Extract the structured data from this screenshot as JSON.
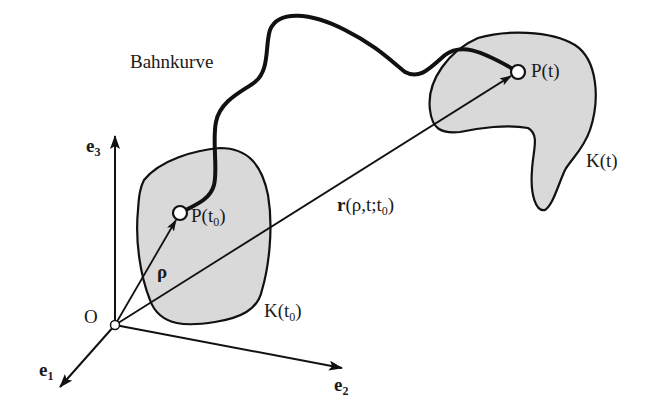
{
  "diagram": {
    "title_label": "Bahnkurve",
    "origin_label": "O",
    "axes": [
      {
        "name": "e1",
        "base": "e",
        "sub": "1"
      },
      {
        "name": "e2",
        "base": "e",
        "sub": "2"
      },
      {
        "name": "e3",
        "base": "e",
        "sub": "3"
      }
    ],
    "points": [
      {
        "name": "P(t0)",
        "base": "P(t",
        "sub": "0",
        "close": ")"
      },
      {
        "name": "P(t)",
        "text": "P(t)"
      }
    ],
    "bodies": [
      {
        "name": "K(t0)",
        "base": "K(t",
        "sub": "0",
        "close": ")"
      },
      {
        "name": "K(t)",
        "text": "K(t)"
      }
    ],
    "vectors": {
      "rho": "ρ",
      "r_base": "r",
      "r_args": "(ρ,t;t",
      "r_sub": "0",
      "r_close": ")"
    },
    "colors": {
      "body_fill": "#d9d9d9",
      "stroke": "#111111",
      "background": "#ffffff"
    }
  }
}
